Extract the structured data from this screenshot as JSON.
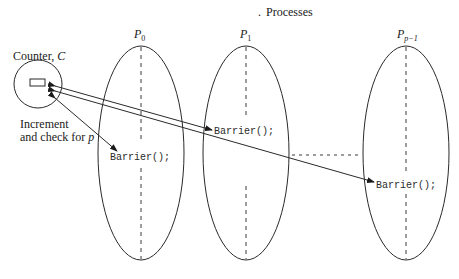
{
  "title": "Processes",
  "counter": {
    "label": "Counter, ",
    "var": "C"
  },
  "increment_label": {
    "line1": "Increment",
    "line2": "and check for ",
    "var": "p"
  },
  "processes": [
    {
      "name": "P",
      "sub": "0",
      "barrier": "Barrier();"
    },
    {
      "name": "P",
      "sub": "1",
      "barrier": "Barrier();"
    },
    {
      "name": "P",
      "sub": "p−1",
      "barrier": "Barrier();"
    }
  ]
}
